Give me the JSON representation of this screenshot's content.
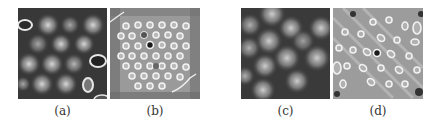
{
  "figure": {
    "panels": [
      {
        "id": "a",
        "label": "(a)",
        "style": "blurred-spots",
        "background": "#3a3a3a"
      },
      {
        "id": "b",
        "label": "(b)",
        "style": "ring-lattice",
        "background": "#9a9a9a"
      },
      {
        "id": "c",
        "label": "(c)",
        "style": "blurred-spots",
        "background": "#3c3c3c"
      },
      {
        "id": "d",
        "label": "(d)",
        "style": "diagonal-rings",
        "background": "#9c9c9c"
      }
    ]
  }
}
